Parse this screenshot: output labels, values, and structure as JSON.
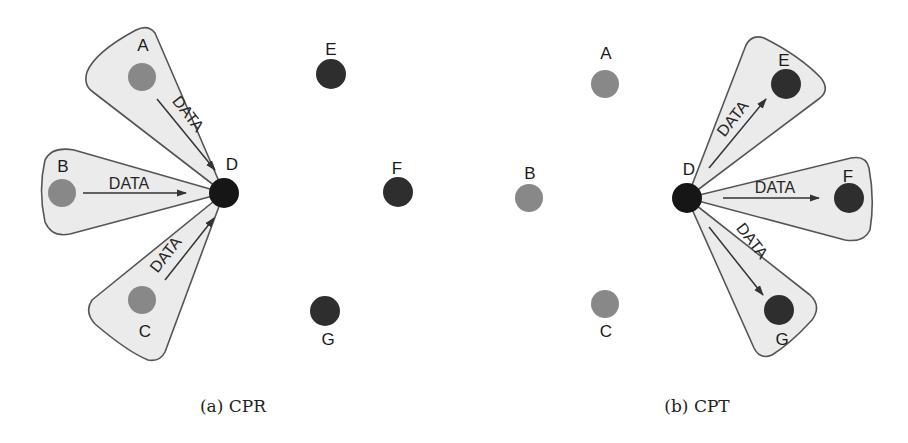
{
  "figure": {
    "colors": {
      "relay_node": "#888888",
      "dest_node": "#2e2e2e",
      "source_node": "#161616",
      "beam_fill": "#ebebeb",
      "beam_stroke": "#555555"
    },
    "panels": [
      {
        "id": "a",
        "caption": "(a) CPR",
        "center": {
          "label": "D",
          "x": 224,
          "y": 193
        },
        "nodes": [
          {
            "label": "A",
            "x": 142,
            "y": 77,
            "lx": 143,
            "ly": 51,
            "type": "relay"
          },
          {
            "label": "B",
            "x": 62,
            "y": 193,
            "lx": 63,
            "ly": 172,
            "type": "relay"
          },
          {
            "label": "C",
            "x": 142,
            "y": 300,
            "lx": 145,
            "ly": 337,
            "type": "relay"
          },
          {
            "label": "E",
            "x": 331,
            "y": 74,
            "lx": 331,
            "ly": 55,
            "type": "dest"
          },
          {
            "label": "F",
            "x": 398,
            "y": 192,
            "lx": 397,
            "ly": 174,
            "type": "dest"
          },
          {
            "label": "G",
            "x": 325,
            "y": 311,
            "lx": 328,
            "ly": 345,
            "type": "dest"
          }
        ],
        "flows": [
          {
            "from": "A",
            "to": "D",
            "label": "DATA"
          },
          {
            "from": "B",
            "to": "D",
            "label": "DATA"
          },
          {
            "from": "C",
            "to": "D",
            "label": "DATA"
          }
        ]
      },
      {
        "id": "b",
        "caption": "(b) CPT",
        "center": {
          "label": "D",
          "x": 687,
          "y": 198
        },
        "nodes": [
          {
            "label": "A",
            "x": 605,
            "y": 84,
            "lx": 606,
            "ly": 59,
            "type": "relay"
          },
          {
            "label": "B",
            "x": 529,
            "y": 198,
            "lx": 530,
            "ly": 179,
            "type": "relay"
          },
          {
            "label": "C",
            "x": 605,
            "y": 304,
            "lx": 606,
            "ly": 337,
            "type": "relay"
          },
          {
            "label": "E",
            "x": 786,
            "y": 84,
            "lx": 784,
            "ly": 66,
            "type": "dest"
          },
          {
            "label": "F",
            "x": 849,
            "y": 198,
            "lx": 848,
            "ly": 182,
            "type": "dest"
          },
          {
            "label": "G",
            "x": 779,
            "y": 310,
            "lx": 782,
            "ly": 345,
            "type": "dest"
          }
        ],
        "flows": [
          {
            "from": "D",
            "to": "E",
            "label": "DATA"
          },
          {
            "from": "D",
            "to": "F",
            "label": "DATA"
          },
          {
            "from": "D",
            "to": "G",
            "label": "DATA"
          }
        ]
      }
    ]
  },
  "labels": {
    "a_caption": "(a) CPR",
    "b_caption": "(b) CPT",
    "data": "DATA",
    "a_D": "D",
    "a_A": "A",
    "a_B": "B",
    "a_C": "C",
    "a_E": "E",
    "a_F": "F",
    "a_G": "G",
    "b_D": "D",
    "b_A": "A",
    "b_B": "B",
    "b_C": "C",
    "b_E": "E",
    "b_F": "F",
    "b_G": "G"
  }
}
